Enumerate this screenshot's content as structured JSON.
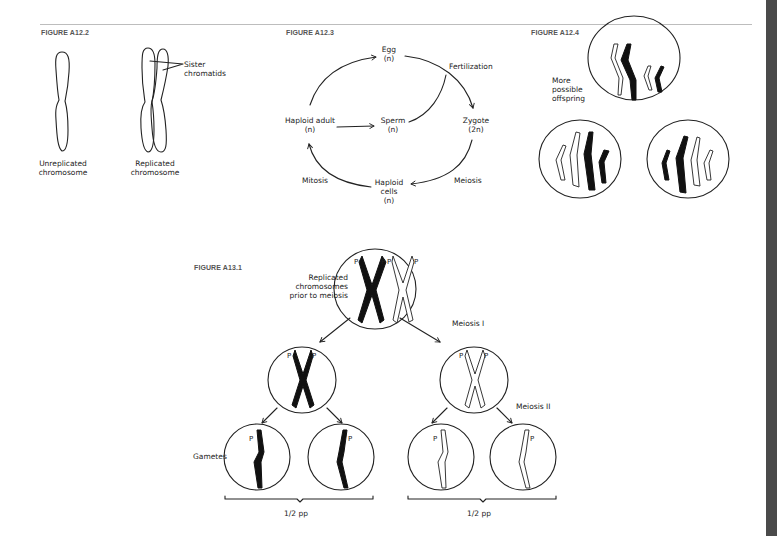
{
  "figures": {
    "a12_2": {
      "title": "FIGURE A12.2",
      "labels": {
        "unreplicated_line1": "Unreplicated",
        "unreplicated_line2": "chromosome",
        "replicated_line1": "Replicated",
        "replicated_line2": "chromosome",
        "sister_line1": "Sister",
        "sister_line2": "chromatids"
      }
    },
    "a12_3": {
      "title": "FIGURE A12.3",
      "nodes": {
        "egg": "Egg",
        "egg_ploidy": "(n)",
        "zygote": "Zygote",
        "zygote_ploidy": "(2n)",
        "haploid_cells_line1": "Haploid",
        "haploid_cells_line2": "cells",
        "haploid_cells_ploidy": "(n)",
        "haploid_adult": "Haploid adult",
        "haploid_adult_ploidy": "(n)",
        "sperm": "Sperm",
        "sperm_ploidy": "(n)"
      },
      "processes": {
        "fertilization": "Fertilization",
        "meiosis": "Meiosis",
        "mitosis": "Mitosis"
      }
    },
    "a12_4": {
      "title": "FIGURE A12.4",
      "labels": {
        "line1": "More",
        "line2": "possible",
        "line3": "offspring"
      }
    },
    "a13_1": {
      "title": "FIGURE A13.1",
      "labels": {
        "replicated_line1": "Replicated",
        "replicated_line2": "chromosomes",
        "replicated_line3": "prior to meiosis",
        "meiosis_1": "Meiosis I",
        "meiosis_2": "Meiosis II",
        "gametes": "Gametes",
        "left_fraction": "1/2 pp",
        "right_fraction": "1/2 pp",
        "allele": "P"
      }
    }
  }
}
